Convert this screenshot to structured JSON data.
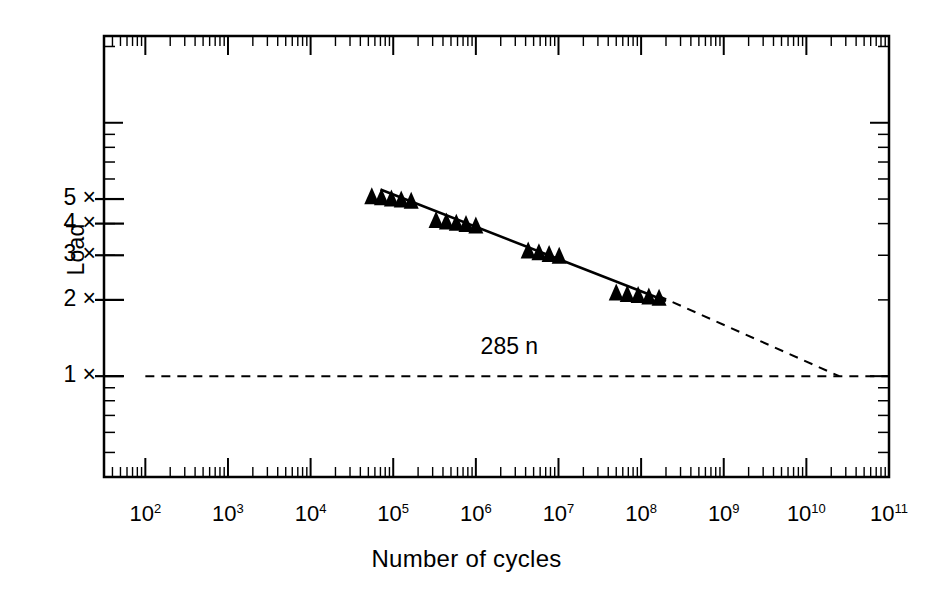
{
  "chart_data": {
    "type": "scatter",
    "title": "",
    "xlabel": "Number of cycles",
    "ylabel": "Load",
    "xscale": "log",
    "yscale": "log",
    "xlim": [
      31.6,
      100000000000
    ],
    "ylim": [
      0.4,
      22
    ],
    "grid": false,
    "legend": null,
    "xtick_labels": [
      "10²",
      "10³",
      "10⁴",
      "10⁵",
      "10⁶",
      "10⁷",
      "10⁸",
      "10⁹",
      "10¹⁰",
      "10¹¹"
    ],
    "xtick_bases": [
      "10",
      "10",
      "10",
      "10",
      "10",
      "10",
      "10",
      "10",
      "10",
      "10"
    ],
    "xtick_exponents": [
      "2",
      "3",
      "4",
      "5",
      "6",
      "7",
      "8",
      "9",
      "10",
      "11"
    ],
    "xtick_values": [
      100,
      1000,
      10000,
      100000,
      1000000,
      10000000,
      100000000,
      1000000000,
      10000000000,
      100000000000
    ],
    "ytick_labels": [
      "1 ×",
      "2 ×",
      "3 ×",
      "4 ×",
      "5 ×"
    ],
    "ytick_values": [
      1,
      2,
      3,
      4,
      5
    ],
    "series": [
      {
        "name": "Fatigue data points",
        "marker": "filled-triangle",
        "color": "#000000",
        "clusters": [
          {
            "label": "cluster-1",
            "x": [
              55000,
              72000,
              95000,
              125000,
              165000
            ],
            "y": [
              5.15,
              5.1,
              5.05,
              5.0,
              4.95
            ]
          },
          {
            "label": "cluster-2",
            "x": [
              330000,
              440000,
              580000,
              760000,
              1000000
            ],
            "y": [
              4.15,
              4.1,
              4.05,
              4.0,
              3.95
            ]
          },
          {
            "label": "cluster-3",
            "x": [
              4300000,
              5800000,
              7700000,
              10200000
            ],
            "y": [
              3.15,
              3.1,
              3.05,
              3.0
            ]
          },
          {
            "label": "cluster-4",
            "x": [
              50000000,
              68000000,
              92000000,
              124000000,
              165000000
            ],
            "y": [
              2.15,
              2.12,
              2.1,
              2.07,
              2.05
            ]
          }
        ]
      }
    ],
    "fit_line": {
      "name": "S-N regression line",
      "style": "solid",
      "x": [
        70000,
        200000000
      ],
      "y": [
        5.45,
        1.98
      ]
    },
    "extrapolation_line": {
      "name": "extrapolated S-N line",
      "style": "dashed",
      "x": [
        160000000,
        25000000000
      ],
      "y": [
        2.08,
        1.0
      ]
    },
    "endurance_line": {
      "name": "endurance-limit reference line",
      "style": "dashed",
      "y": 1.0,
      "x": [
        100,
        100000000000
      ]
    },
    "annotations": [
      {
        "name": "load-annotation",
        "text": "285 n",
        "x": 4000000,
        "y": 1.28
      }
    ]
  },
  "axis_frame": {
    "name": "plot-frame",
    "border_color": "#000000",
    "border_width": 2
  }
}
